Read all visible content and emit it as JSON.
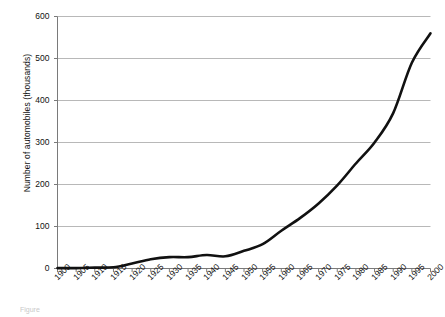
{
  "chart_data": {
    "type": "line",
    "title": "",
    "xlabel": "",
    "ylabel": "Number of automobiles (thousands)",
    "xlim": [
      1900,
      2000
    ],
    "ylim": [
      0,
      600
    ],
    "grid": "horizontal",
    "legend": "none",
    "line_color": "#111111",
    "grid_color": "#b0b0b0",
    "axis_color": "#7a7a7a",
    "x": [
      1900,
      1905,
      1910,
      1915,
      1920,
      1925,
      1930,
      1935,
      1940,
      1945,
      1950,
      1955,
      1960,
      1965,
      1970,
      1975,
      1980,
      1985,
      1990,
      1995,
      2000
    ],
    "values": [
      1,
      1,
      2,
      3,
      12,
      22,
      27,
      27,
      32,
      29,
      42,
      58,
      90,
      120,
      155,
      198,
      250,
      300,
      370,
      490,
      560
    ],
    "yticks": [
      0,
      100,
      200,
      300,
      400,
      500,
      600
    ],
    "ytick_labels": [
      "0",
      "100",
      "200",
      "300",
      "400",
      "500",
      "600"
    ],
    "xtick_labels": [
      "1900",
      "1905",
      "1910",
      "1915",
      "1920",
      "1925",
      "1930",
      "1935",
      "1940",
      "1945",
      "1950",
      "1955",
      "1960",
      "1965",
      "1970",
      "1975",
      "1980",
      "1985",
      "1990",
      "1995",
      "2000"
    ]
  },
  "caption": {
    "text": "Figure"
  }
}
